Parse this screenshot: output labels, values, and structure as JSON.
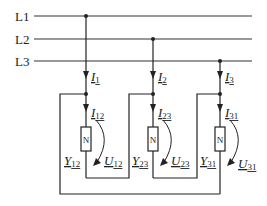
{
  "diagram": {
    "type": "three-phase delta-connected load circuit",
    "lines": [
      {
        "label": "L1"
      },
      {
        "label": "L2"
      },
      {
        "label": "L3"
      }
    ],
    "line_currents": [
      {
        "symbol": "I",
        "sub": "1"
      },
      {
        "symbol": "I",
        "sub": "2"
      },
      {
        "symbol": "I",
        "sub": "3"
      }
    ],
    "branches": [
      {
        "current": {
          "symbol": "I",
          "sub": "12"
        },
        "admittance": {
          "symbol": "Y",
          "sub": "12"
        },
        "voltage": {
          "symbol": "U",
          "sub": "12"
        },
        "element": "N"
      },
      {
        "current": {
          "symbol": "I",
          "sub": "23"
        },
        "admittance": {
          "symbol": "Y",
          "sub": "23"
        },
        "voltage": {
          "symbol": "U",
          "sub": "23"
        },
        "element": "N"
      },
      {
        "current": {
          "symbol": "I",
          "sub": "31"
        },
        "admittance": {
          "symbol": "Y",
          "sub": "31"
        },
        "voltage": {
          "symbol": "U",
          "sub": "31"
        },
        "element": "N"
      }
    ],
    "colors": {
      "stroke": "#222222",
      "background": "#ffffff"
    }
  }
}
